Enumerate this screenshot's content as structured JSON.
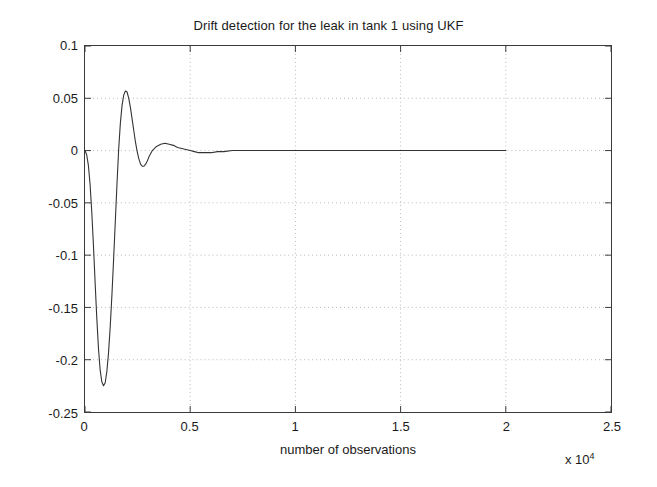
{
  "chart_data": {
    "type": "line",
    "title": "Drift detection for the leak in tank 1 using UKF",
    "xlabel": "number of observations",
    "ylabel": "drift",
    "x_exponent_prefix": "x 10",
    "x_exponent_power": "4",
    "x_multiplier": 10000,
    "xlim": [
      0,
      2.5
    ],
    "ylim": [
      -0.25,
      0.1
    ],
    "grid": true,
    "legend": null,
    "xticks": [
      "0",
      "0.5",
      "1",
      "1.5",
      "2",
      "2.5"
    ],
    "xtick_values": [
      0,
      0.5,
      1,
      1.5,
      2,
      2.5
    ],
    "yticks": [
      "0.1",
      "0.05",
      "0",
      "-0.05",
      "-0.1",
      "-0.15",
      "-0.2",
      "-0.25"
    ],
    "ytick_values": [
      0.1,
      0.05,
      0,
      -0.05,
      -0.1,
      -0.15,
      -0.2,
      -0.25
    ],
    "line_color": "#333333",
    "series": [
      {
        "name": "drift",
        "x": [
          0,
          0.008,
          0.016,
          0.024,
          0.032,
          0.04,
          0.048,
          0.056,
          0.064,
          0.072,
          0.08,
          0.088,
          0.096,
          0.104,
          0.112,
          0.12,
          0.128,
          0.136,
          0.144,
          0.152,
          0.16,
          0.168,
          0.176,
          0.184,
          0.192,
          0.2,
          0.208,
          0.216,
          0.224,
          0.232,
          0.24,
          0.248,
          0.256,
          0.264,
          0.272,
          0.28,
          0.288,
          0.296,
          0.304,
          0.32,
          0.34,
          0.36,
          0.38,
          0.4,
          0.42,
          0.44,
          0.46,
          0.48,
          0.5,
          0.52,
          0.54,
          0.56,
          0.58,
          0.6,
          0.63,
          0.66,
          0.7,
          0.75,
          0.8,
          0.9,
          1.0,
          1.1,
          1.2,
          1.3,
          1.4,
          1.5,
          1.6,
          1.7,
          1.8,
          1.9,
          2.0
        ],
        "y": [
          0,
          -0.004,
          -0.014,
          -0.032,
          -0.058,
          -0.09,
          -0.126,
          -0.16,
          -0.189,
          -0.21,
          -0.221,
          -0.225,
          -0.222,
          -0.211,
          -0.193,
          -0.168,
          -0.138,
          -0.104,
          -0.068,
          -0.032,
          0.001,
          0.026,
          0.043,
          0.053,
          0.057,
          0.056,
          0.05,
          0.041,
          0.03,
          0.019,
          0.008,
          -0.001,
          -0.008,
          -0.013,
          -0.015,
          -0.015,
          -0.013,
          -0.01,
          -0.006,
          0.0,
          0.004,
          0.006,
          0.007,
          0.006,
          0.005,
          0.003,
          0.002,
          0.001,
          0.0,
          -0.001,
          -0.002,
          -0.002,
          -0.002,
          -0.002,
          -0.001,
          -0.001,
          0.0,
          0.0,
          0.0,
          0.0,
          0.0,
          0.0,
          0.0,
          0.0,
          0.0,
          0.0,
          0.0,
          0.0,
          0.0,
          0.0,
          0.0
        ]
      }
    ]
  }
}
